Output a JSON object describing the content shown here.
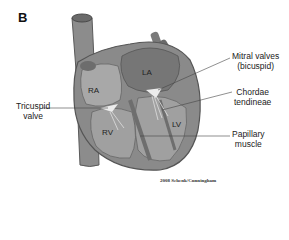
{
  "panel_letter": "B",
  "chambers": {
    "ra": "RA",
    "la": "LA",
    "rv": "RV",
    "lv": "LV"
  },
  "labels": {
    "mitral_line1": "Mitral valves",
    "mitral_line2": "(bicuspid)",
    "chordae_line1": "Chordae",
    "chordae_line2": "tendineae",
    "tricuspid_line1": "Tricuspid",
    "tricuspid_line2": "valve",
    "papillary_line1": "Papillary",
    "papillary_line2": "muscle"
  },
  "credit": "2008 Schenk/Cunningham",
  "colors": {
    "wall": "#8a8a8a",
    "wall_dark": "#5e5e5e",
    "chamber": "#a9a9a9",
    "la_fill": "#777777",
    "valve": "#e8e8e8",
    "line": "#555555"
  }
}
